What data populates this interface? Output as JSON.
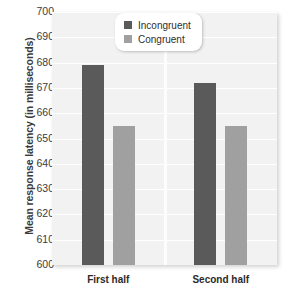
{
  "chart_data": {
    "type": "bar",
    "title": "",
    "xlabel": "",
    "ylabel": "Mean response latency (in milliseconds)",
    "categories": [
      "First half",
      "Second half"
    ],
    "series": [
      {
        "name": "Incongruent",
        "values": [
          679,
          672
        ],
        "color": "#5a5a5a"
      },
      {
        "name": "Congruent",
        "values": [
          655,
          655
        ],
        "color": "#a0a0a0"
      }
    ],
    "ylim": [
      600,
      700
    ],
    "ytick_step": 10,
    "yticks": [
      700,
      690,
      680,
      670,
      660,
      650,
      640,
      630,
      620,
      610,
      600
    ],
    "grid": true,
    "legend_position": "top-center",
    "plot_background": "#f2f2f2",
    "gridline_color": "#ffffff"
  },
  "legend": {
    "items": [
      {
        "label": "Incongruent",
        "color": "#5a5a5a"
      },
      {
        "label": "Congruent",
        "color": "#a0a0a0"
      }
    ]
  }
}
